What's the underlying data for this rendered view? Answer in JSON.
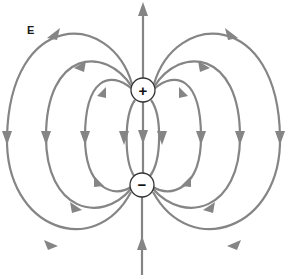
{
  "diagram": {
    "field_label": "E",
    "charges": [
      {
        "name": "positive",
        "symbol": "+",
        "cx": 143,
        "cy": 90,
        "r": 12
      },
      {
        "name": "negative",
        "symbol": "−",
        "cx": 142,
        "cy": 185,
        "r": 12
      }
    ],
    "line_color": "#858585",
    "field_line_count": 9,
    "arrow_direction": "from positive charge to negative charge"
  }
}
